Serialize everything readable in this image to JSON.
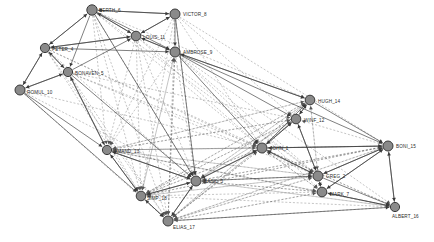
{
  "diagram": {
    "type": "social-network-graph",
    "title": "",
    "background_color": "#ffffff",
    "node_fill": "#8a8a8a",
    "node_stroke": "#3a3a3a",
    "solid_edge_color": "#3a3a3a",
    "dashed_edge_color": "#555555",
    "label_color": "#2a2a2a",
    "node_count": 18,
    "nodes": [
      {
        "id": 1,
        "label": "GREG_2",
        "x": 318,
        "y": 176,
        "r": 5.0,
        "label_dx": 8,
        "label_dy": 2
      },
      {
        "id": 2,
        "label": "BASIL_3",
        "x": 196,
        "y": 181,
        "r": 5.0,
        "label_dx": 8,
        "label_dy": 2
      },
      {
        "id": 3,
        "label": "PETER_4",
        "x": 45,
        "y": 48,
        "r": 4.6,
        "label_dx": 7,
        "label_dy": 3
      },
      {
        "id": 4,
        "label": "BONAVEN_5",
        "x": 68,
        "y": 72,
        "r": 4.6,
        "label_dx": 7,
        "label_dy": 3
      },
      {
        "id": 5,
        "label": "BERTH_6",
        "x": 92,
        "y": 10,
        "r": 5.2,
        "label_dx": 7,
        "label_dy": 2
      },
      {
        "id": 6,
        "label": "MARK_7",
        "x": 322,
        "y": 192,
        "r": 4.8,
        "label_dx": 8,
        "label_dy": 4
      },
      {
        "id": 7,
        "label": "VICTOR_8",
        "x": 175,
        "y": 14,
        "r": 5.0,
        "label_dx": 8,
        "label_dy": 2
      },
      {
        "id": 8,
        "label": "AMBROSE_9",
        "x": 175,
        "y": 52,
        "r": 5.0,
        "label_dx": 8,
        "label_dy": 2
      },
      {
        "id": 9,
        "label": "ROMUL_10",
        "x": 20,
        "y": 90,
        "r": 5.0,
        "label_dx": 7,
        "label_dy": 4
      },
      {
        "id": 10,
        "label": "LOUIS_11",
        "x": 136,
        "y": 36,
        "r": 4.8,
        "label_dx": 7,
        "label_dy": 3
      },
      {
        "id": 11,
        "label": "WINF_12",
        "x": 296,
        "y": 119,
        "r": 4.8,
        "label_dx": 8,
        "label_dy": 3
      },
      {
        "id": 12,
        "label": "AMAND_13",
        "x": 107,
        "y": 150,
        "r": 4.6,
        "label_dx": 7,
        "label_dy": 3
      },
      {
        "id": 13,
        "label": "HUGH_14",
        "x": 310,
        "y": 100,
        "r": 4.8,
        "label_dx": 8,
        "label_dy": 3
      },
      {
        "id": 14,
        "label": "BONI_15",
        "x": 388,
        "y": 146,
        "r": 5.0,
        "label_dx": 8,
        "label_dy": 2
      },
      {
        "id": 15,
        "label": "ALBERT_16",
        "x": 395,
        "y": 207,
        "r": 4.6,
        "label_dx": -3,
        "label_dy": 11
      },
      {
        "id": 16,
        "label": "ELIAS_17",
        "x": 168,
        "y": 221,
        "r": 5.0,
        "label_dx": 5,
        "label_dy": 8
      },
      {
        "id": 17,
        "label": "SIMP_18",
        "x": 141,
        "y": 196,
        "r": 4.8,
        "label_dx": 6,
        "label_dy": 4
      },
      {
        "id": 18,
        "label": "JOHN_1",
        "x": 262,
        "y": 148,
        "r": 5.0,
        "label_dx": 8,
        "label_dy": 2
      }
    ],
    "edges_solid": [
      [
        5,
        7
      ],
      [
        5,
        3
      ],
      [
        5,
        4
      ],
      [
        5,
        10
      ],
      [
        5,
        8
      ],
      [
        5,
        2
      ],
      [
        7,
        10
      ],
      [
        7,
        8
      ],
      [
        7,
        5
      ],
      [
        7,
        2
      ],
      [
        3,
        4
      ],
      [
        3,
        9
      ],
      [
        3,
        5
      ],
      [
        3,
        10
      ],
      [
        3,
        8
      ],
      [
        4,
        9
      ],
      [
        4,
        3
      ],
      [
        4,
        12
      ],
      [
        4,
        2
      ],
      [
        4,
        10
      ],
      [
        9,
        4
      ],
      [
        9,
        3
      ],
      [
        9,
        12
      ],
      [
        9,
        17
      ],
      [
        10,
        8
      ],
      [
        10,
        5
      ],
      [
        10,
        7
      ],
      [
        10,
        3
      ],
      [
        8,
        10
      ],
      [
        8,
        13
      ],
      [
        8,
        14
      ],
      [
        8,
        18
      ],
      [
        8,
        11
      ],
      [
        12,
        2
      ],
      [
        12,
        17
      ],
      [
        12,
        4
      ],
      [
        2,
        18
      ],
      [
        2,
        1
      ],
      [
        2,
        17
      ],
      [
        2,
        16
      ],
      [
        2,
        12
      ],
      [
        18,
        1
      ],
      [
        18,
        11
      ],
      [
        18,
        13
      ],
      [
        18,
        14
      ],
      [
        18,
        2
      ],
      [
        1,
        6
      ],
      [
        1,
        14
      ],
      [
        1,
        18
      ],
      [
        1,
        11
      ],
      [
        1,
        15
      ],
      [
        6,
        1
      ],
      [
        6,
        14
      ],
      [
        6,
        15
      ],
      [
        11,
        13
      ],
      [
        11,
        18
      ],
      [
        11,
        1
      ],
      [
        13,
        14
      ],
      [
        13,
        11
      ],
      [
        13,
        8
      ],
      [
        14,
        15
      ],
      [
        14,
        1
      ],
      [
        14,
        6
      ],
      [
        14,
        18
      ],
      [
        15,
        6
      ],
      [
        15,
        14
      ],
      [
        17,
        16
      ],
      [
        17,
        2
      ],
      [
        17,
        12
      ],
      [
        16,
        17
      ],
      [
        16,
        2
      ],
      [
        16,
        15
      ]
    ],
    "edges_dashed": [
      [
        5,
        12
      ],
      [
        5,
        17
      ],
      [
        5,
        16
      ],
      [
        5,
        2
      ],
      [
        5,
        1
      ],
      [
        5,
        18
      ],
      [
        5,
        13
      ],
      [
        7,
        12
      ],
      [
        7,
        16
      ],
      [
        7,
        17
      ],
      [
        7,
        2
      ],
      [
        7,
        18
      ],
      [
        7,
        11
      ],
      [
        7,
        14
      ],
      [
        3,
        16
      ],
      [
        3,
        17
      ],
      [
        3,
        2
      ],
      [
        3,
        18
      ],
      [
        3,
        1
      ],
      [
        4,
        16
      ],
      [
        4,
        17
      ],
      [
        4,
        18
      ],
      [
        4,
        1
      ],
      [
        4,
        11
      ],
      [
        9,
        16
      ],
      [
        9,
        2
      ],
      [
        9,
        18
      ],
      [
        10,
        2
      ],
      [
        10,
        12
      ],
      [
        10,
        16
      ],
      [
        10,
        17
      ],
      [
        10,
        1
      ],
      [
        10,
        18
      ],
      [
        8,
        2
      ],
      [
        8,
        12
      ],
      [
        8,
        16
      ],
      [
        8,
        17
      ],
      [
        8,
        1
      ],
      [
        8,
        6
      ],
      [
        8,
        15
      ],
      [
        12,
        18
      ],
      [
        12,
        1
      ],
      [
        12,
        11
      ],
      [
        12,
        13
      ],
      [
        12,
        14
      ],
      [
        12,
        6
      ],
      [
        2,
        13
      ],
      [
        2,
        11
      ],
      [
        2,
        14
      ],
      [
        2,
        6
      ],
      [
        2,
        15
      ],
      [
        18,
        16
      ],
      [
        18,
        17
      ],
      [
        18,
        12
      ],
      [
        18,
        15
      ],
      [
        18,
        6
      ],
      [
        1,
        16
      ],
      [
        1,
        17
      ],
      [
        1,
        12
      ],
      [
        1,
        2
      ],
      [
        1,
        13
      ],
      [
        6,
        16
      ],
      [
        6,
        17
      ],
      [
        6,
        2
      ],
      [
        6,
        12
      ],
      [
        6,
        18
      ],
      [
        11,
        16
      ],
      [
        11,
        2
      ],
      [
        11,
        12
      ],
      [
        11,
        17
      ],
      [
        13,
        2
      ],
      [
        13,
        16
      ],
      [
        13,
        17
      ],
      [
        13,
        12
      ],
      [
        13,
        1
      ],
      [
        14,
        2
      ],
      [
        14,
        16
      ],
      [
        14,
        17
      ],
      [
        14,
        12
      ],
      [
        14,
        11
      ],
      [
        15,
        16
      ],
      [
        15,
        2
      ],
      [
        15,
        17
      ],
      [
        15,
        18
      ],
      [
        15,
        12
      ],
      [
        17,
        1
      ],
      [
        17,
        18
      ],
      [
        17,
        11
      ],
      [
        17,
        13
      ],
      [
        17,
        14
      ],
      [
        17,
        8
      ],
      [
        16,
        1
      ],
      [
        16,
        18
      ],
      [
        16,
        11
      ],
      [
        16,
        13
      ],
      [
        16,
        14
      ],
      [
        16,
        8
      ],
      [
        16,
        6
      ]
    ]
  }
}
